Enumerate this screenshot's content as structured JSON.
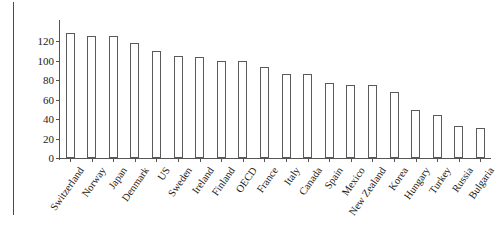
{
  "chart_data": {
    "type": "bar",
    "title": "",
    "subtitle": "",
    "xlabel": "",
    "ylabel": "",
    "ylim": [
      0,
      140
    ],
    "yticks": [
      0,
      20,
      40,
      60,
      80,
      100,
      120
    ],
    "grid": false,
    "legend": null,
    "categories": [
      "Switzerland",
      "Norway",
      "Japan",
      "Denmark",
      "US",
      "Sweden",
      "Ireland",
      "Finland",
      "OECD",
      "France",
      "Italy",
      "Canada",
      "Spain",
      "Mexico",
      "New Zealand",
      "Korea",
      "Hungary",
      "Turkey",
      "Russia",
      "Bulgaria"
    ],
    "values": [
      129,
      126,
      126,
      118,
      110,
      105,
      104,
      100,
      100,
      94,
      86,
      86,
      77,
      75,
      75,
      68,
      49,
      44,
      33,
      31
    ],
    "bar_style": {
      "fill": "#ffffff",
      "edge": "#5a5a5a"
    }
  }
}
